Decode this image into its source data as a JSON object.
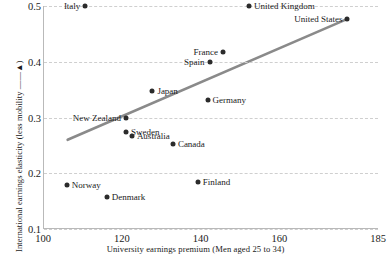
{
  "chart_data": {
    "type": "scatter",
    "title": "",
    "xlabel": "University earnings premium (Men aged 25 to 34)",
    "ylabel": "International earnings elasticity (less mobility ——▲)",
    "xlim": [
      100,
      185
    ],
    "ylim": [
      0.1,
      0.5
    ],
    "xticks": [
      100,
      120,
      140,
      160,
      185
    ],
    "yticks": [
      0.1,
      0.2,
      0.3,
      0.4,
      0.5
    ],
    "ytick_labels": [
      "0.1",
      "0.2",
      "0.3",
      "0.4",
      "0.5"
    ],
    "xtick_labels": [
      "100",
      "120",
      "140",
      "160",
      "185"
    ],
    "grid": "horizontal-dashed",
    "legend": "none",
    "point_color": "#2b2b2b",
    "trend_color": "#8a8a8a",
    "points": [
      {
        "label": "Italy",
        "x": 110.5,
        "y": 0.5,
        "label_side": "left"
      },
      {
        "label": "United Kingdom",
        "x": 152.0,
        "y": 0.5,
        "label_side": "right"
      },
      {
        "label": "United States",
        "x": 177.0,
        "y": 0.477,
        "label_side": "left"
      },
      {
        "label": "France",
        "x": 145.4,
        "y": 0.417,
        "label_side": "left"
      },
      {
        "label": "Spain",
        "x": 142.0,
        "y": 0.4,
        "label_side": "left"
      },
      {
        "label": "Japan",
        "x": 127.5,
        "y": 0.348,
        "label_side": "right"
      },
      {
        "label": "Germany",
        "x": 141.5,
        "y": 0.331,
        "label_side": "right"
      },
      {
        "label": "New Zealand",
        "x": 120.8,
        "y": 0.3,
        "label_side": "left"
      },
      {
        "label": "Sweden",
        "x": 120.8,
        "y": 0.274,
        "label_side": "right"
      },
      {
        "label": "Australia",
        "x": 122.3,
        "y": 0.267,
        "label_side": "right"
      },
      {
        "label": "Canada",
        "x": 132.7,
        "y": 0.252,
        "label_side": "right"
      },
      {
        "label": "Finland",
        "x": 139.0,
        "y": 0.185,
        "label_side": "right"
      },
      {
        "label": "Norway",
        "x": 105.8,
        "y": 0.179,
        "label_side": "right"
      },
      {
        "label": "Denmark",
        "x": 115.9,
        "y": 0.157,
        "label_side": "right"
      }
    ],
    "trendline": {
      "x0": 106.0,
      "y0": 0.26,
      "x1": 177.0,
      "y1": 0.477
    }
  }
}
